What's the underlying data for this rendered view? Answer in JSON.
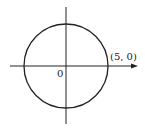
{
  "diagram": {
    "type": "circle-on-axes",
    "origin_label": "0",
    "point_label": "(5, 0)",
    "circle": {
      "center": [
        0,
        0
      ],
      "radius": 5
    },
    "stroke_color": "#222222"
  }
}
